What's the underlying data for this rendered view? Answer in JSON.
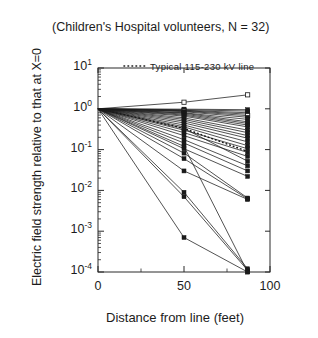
{
  "chart_data": {
    "type": "line",
    "title": "(Children's Hospital volunteers, N = 32)",
    "xlabel": "Distance from line (feet)",
    "ylabel": "Electric field strength relative to that at X=0",
    "xlim": [
      0,
      100
    ],
    "ylim": [
      0.0001,
      10
    ],
    "yscale": "log",
    "grid": false,
    "legend_position": "inside-top-center",
    "x_ticks": [
      0,
      50,
      100
    ],
    "x_tick_labels": [
      "0",
      "50",
      "100"
    ],
    "y_ticks": [
      10,
      1,
      0.1,
      0.01,
      0.001,
      0.0001
    ],
    "y_tick_labels": [
      "10¹",
      "10⁰",
      "10⁻¹",
      "10⁻²",
      "10⁻³",
      "10⁻⁴"
    ],
    "y_tick_mantissa": [
      "10",
      "10",
      "10",
      "10",
      "10",
      "10"
    ],
    "y_tick_exponent": [
      "1",
      "0",
      "-1",
      "-2",
      "-3",
      "-4"
    ],
    "x": [
      0,
      50,
      87
    ],
    "annotations": [
      {
        "text": "Typical  115-230  kV  line",
        "style": "dotted",
        "marker": "none"
      }
    ],
    "legend": [
      {
        "label": "Typical  115-230  kV  line",
        "style": "dotted"
      }
    ],
    "reference_series": {
      "name": "Typical 115-230 kV line",
      "style": "dotted",
      "values": [
        1.0,
        0.33,
        0.09
      ]
    },
    "series": [
      {
        "name": "v01",
        "marker": "open-square",
        "values": [
          1.0,
          1.45,
          2.2
        ]
      },
      {
        "name": "v02",
        "marker": "filled-square",
        "values": [
          1.0,
          0.98,
          0.95
        ]
      },
      {
        "name": "v03",
        "marker": "filled-square",
        "values": [
          1.0,
          0.95,
          0.88
        ]
      },
      {
        "name": "v04",
        "marker": "filled-square",
        "values": [
          1.0,
          0.92,
          0.8
        ]
      },
      {
        "name": "v05",
        "marker": "filled-square",
        "values": [
          1.0,
          0.9,
          0.74
        ]
      },
      {
        "name": "v06",
        "marker": "open-square",
        "values": [
          1.0,
          0.88,
          0.68
        ]
      },
      {
        "name": "v07",
        "marker": "filled-square",
        "values": [
          1.0,
          0.85,
          0.62
        ]
      },
      {
        "name": "v08",
        "marker": "filled-square",
        "values": [
          1.0,
          0.8,
          0.55
        ]
      },
      {
        "name": "v09",
        "marker": "filled-square",
        "values": [
          1.0,
          0.78,
          0.48
        ]
      },
      {
        "name": "v10",
        "marker": "filled-square",
        "values": [
          1.0,
          0.74,
          0.44
        ]
      },
      {
        "name": "v11",
        "marker": "filled-square",
        "values": [
          1.0,
          0.7,
          0.4
        ]
      },
      {
        "name": "v12",
        "marker": "filled-square",
        "values": [
          1.0,
          0.66,
          0.36
        ]
      },
      {
        "name": "v13",
        "marker": "filled-square",
        "values": [
          1.0,
          0.6,
          0.3
        ]
      },
      {
        "name": "v14",
        "marker": "filled-square",
        "values": [
          1.0,
          0.55,
          0.26
        ]
      },
      {
        "name": "v15",
        "marker": "filled-square",
        "values": [
          1.0,
          0.5,
          0.22
        ]
      },
      {
        "name": "v16",
        "marker": "filled-square",
        "values": [
          1.0,
          0.45,
          0.19
        ]
      },
      {
        "name": "v17",
        "marker": "filled-square",
        "values": [
          1.0,
          0.4,
          0.155
        ]
      },
      {
        "name": "v18",
        "marker": "filled-square",
        "values": [
          1.0,
          0.36,
          0.125
        ]
      },
      {
        "name": "v19",
        "marker": "filled-square",
        "values": [
          1.0,
          0.3,
          0.105
        ]
      },
      {
        "name": "v20",
        "marker": "filled-square",
        "values": [
          1.0,
          0.26,
          0.085
        ]
      },
      {
        "name": "v21",
        "marker": "filled-square",
        "values": [
          1.0,
          0.22,
          0.068
        ]
      },
      {
        "name": "v22",
        "marker": "filled-square",
        "values": [
          1.0,
          0.33,
          0.052
        ]
      },
      {
        "name": "v23",
        "marker": "filled-square",
        "values": [
          1.0,
          0.175,
          0.04
        ]
      },
      {
        "name": "v24",
        "marker": "filled-square",
        "values": [
          1.0,
          0.145,
          0.03
        ]
      },
      {
        "name": "v25",
        "marker": "filled-square",
        "values": [
          1.0,
          0.105,
          0.022
        ]
      },
      {
        "name": "v26",
        "marker": "filled-square",
        "values": [
          1.0,
          0.082,
          0.0065
        ]
      },
      {
        "name": "v27",
        "marker": "filled-square",
        "values": [
          1.0,
          0.06,
          0.0062
        ]
      },
      {
        "name": "v28",
        "marker": "filled-square",
        "values": [
          1.0,
          0.03,
          0.006
        ]
      },
      {
        "name": "v29",
        "marker": "filled-square",
        "values": [
          1.0,
          0.009,
          0.00012
        ]
      },
      {
        "name": "v30",
        "marker": "filled-square",
        "values": [
          1.0,
          0.007,
          0.00011
        ]
      },
      {
        "name": "v31",
        "marker": "filled-square",
        "values": [
          1.0,
          0.0007,
          0.0001
        ]
      },
      {
        "name": "v32",
        "marker": "filled-square",
        "values": [
          1.0,
          0.12,
          0.0001
        ]
      }
    ]
  }
}
